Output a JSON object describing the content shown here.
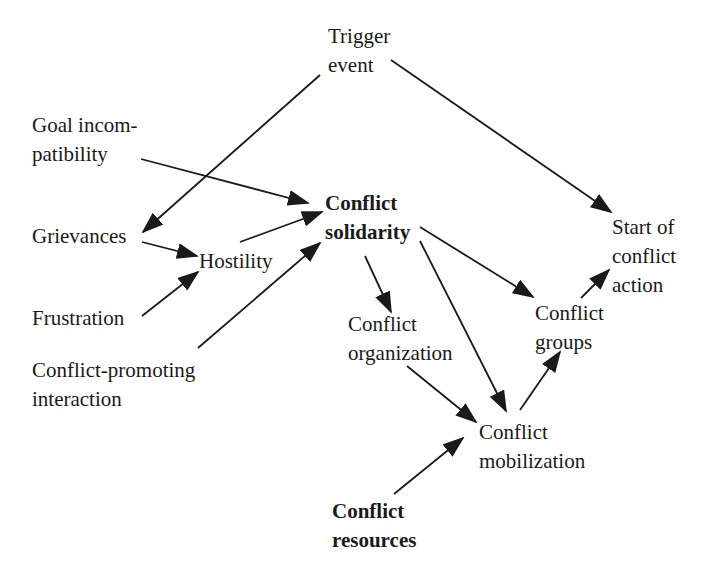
{
  "diagram": {
    "type": "causal-flow-diagram",
    "colors": {
      "text": "#1a1a1a",
      "arrow": "#1a1a1a",
      "background": "#ffffff"
    },
    "nodes": {
      "trigger_event": {
        "lines": [
          "Trigger",
          "event"
        ],
        "bold": false
      },
      "goal_incompatibility": {
        "lines": [
          "Goal incom-",
          "patibility"
        ],
        "bold": false
      },
      "grievances": {
        "lines": [
          "Grievances"
        ],
        "bold": false
      },
      "hostility": {
        "lines": [
          "Hostility"
        ],
        "bold": false
      },
      "frustration": {
        "lines": [
          "Frustration"
        ],
        "bold": false
      },
      "conflict_promoting_interaction": {
        "lines": [
          "Conflict-promoting",
          "interaction"
        ],
        "bold": false
      },
      "conflict_solidarity": {
        "lines": [
          "Conflict",
          "solidarity"
        ],
        "bold": true
      },
      "conflict_organization": {
        "lines": [
          "Conflict",
          "organization"
        ],
        "bold": false
      },
      "conflict_groups": {
        "lines": [
          "Conflict",
          "groups"
        ],
        "bold": false
      },
      "start_of_conflict_action": {
        "lines": [
          "Start of",
          "conflict",
          "action"
        ],
        "bold": false
      },
      "conflict_mobilization": {
        "lines": [
          "Conflict",
          "mobilization"
        ],
        "bold": false
      },
      "conflict_resources": {
        "lines": [
          "Conflict",
          "resources"
        ],
        "bold": true
      }
    },
    "edges": [
      {
        "from": "trigger_event",
        "to": "grievances"
      },
      {
        "from": "trigger_event",
        "to": "start_of_conflict_action"
      },
      {
        "from": "goal_incompatibility",
        "to": "conflict_solidarity"
      },
      {
        "from": "grievances",
        "to": "hostility"
      },
      {
        "from": "frustration",
        "to": "hostility"
      },
      {
        "from": "hostility",
        "to": "conflict_solidarity"
      },
      {
        "from": "conflict_promoting_interaction",
        "to": "conflict_solidarity"
      },
      {
        "from": "conflict_solidarity",
        "to": "conflict_organization"
      },
      {
        "from": "conflict_solidarity",
        "to": "conflict_groups"
      },
      {
        "from": "conflict_solidarity",
        "to": "conflict_mobilization"
      },
      {
        "from": "conflict_organization",
        "to": "conflict_mobilization"
      },
      {
        "from": "conflict_resources",
        "to": "conflict_mobilization"
      },
      {
        "from": "conflict_mobilization",
        "to": "conflict_groups"
      },
      {
        "from": "conflict_groups",
        "to": "start_of_conflict_action"
      }
    ]
  }
}
